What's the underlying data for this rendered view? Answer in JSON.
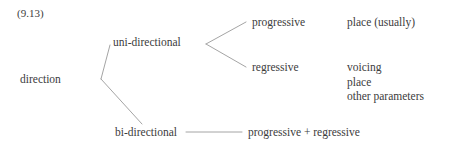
{
  "example_number": "(9.13)",
  "colors": {
    "background": "#ffffff",
    "text": "#3c3c3c",
    "edge": "#9a9a9a"
  },
  "tree": {
    "root": "direction",
    "branches": [
      {
        "label": "uni-directional",
        "children": [
          {
            "label": "progressive",
            "annotations": [
              "place (usually)"
            ]
          },
          {
            "label": "regressive",
            "annotations": [
              "voicing",
              "place",
              "other parameters"
            ]
          }
        ]
      },
      {
        "label": "bi-directional",
        "children": [
          {
            "label": "progressive + regressive",
            "annotations": []
          }
        ]
      }
    ]
  },
  "nodes": {
    "direction": "direction",
    "uni_directional": "uni-directional",
    "bi_directional": "bi-directional",
    "progressive": "progressive",
    "regressive": "regressive",
    "progressive_plus_regressive": "progressive + regressive"
  },
  "annotations": {
    "progressive": "place (usually)",
    "regressive": [
      "voicing",
      "place",
      "other parameters"
    ]
  }
}
